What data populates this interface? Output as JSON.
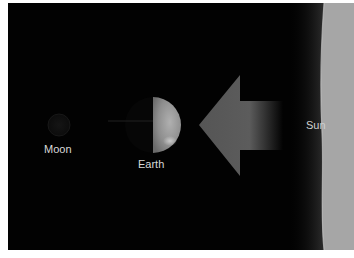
{
  "diagram": {
    "title": "",
    "bodies": [
      {
        "id": "moon",
        "label": "Moon",
        "shape": "circle",
        "lit": false
      },
      {
        "id": "earth",
        "label": "Earth",
        "shape": "circle",
        "lit": "right-half"
      },
      {
        "id": "sun",
        "label": "Sun",
        "shape": "edge-band"
      }
    ],
    "arrow": {
      "direction": "left",
      "meaning": "sunlight",
      "from": "sun",
      "to": "earth"
    },
    "colors": {
      "background": "#020202",
      "border": "#ffffff",
      "label_text": "#d8d8d8",
      "arrow": "#5a5a5a",
      "earth_lit": "#9a9a9a",
      "sun": "#a8a8a8"
    }
  },
  "labels": {
    "moon": "Moon",
    "earth": "Earth",
    "sun": "Sun"
  }
}
